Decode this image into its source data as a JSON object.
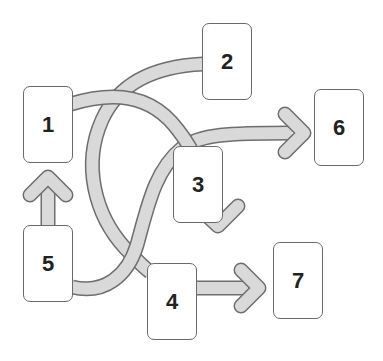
{
  "diagram": {
    "type": "flow",
    "colors": {
      "background": "#ffffff",
      "arrow_fill": "#d9d9d9",
      "arrow_stroke": "#6e6e6e",
      "box_border": "#6a6a6a",
      "label": "#222222"
    },
    "nodes": [
      {
        "id": "1",
        "label": "1",
        "x": 23,
        "y": 86,
        "w": 50,
        "h": 77
      },
      {
        "id": "2",
        "label": "2",
        "x": 202,
        "y": 23,
        "w": 50,
        "h": 77
      },
      {
        "id": "3",
        "label": "3",
        "x": 173,
        "y": 146,
        "w": 50,
        "h": 77
      },
      {
        "id": "4",
        "label": "4",
        "x": 147,
        "y": 263,
        "w": 50,
        "h": 77
      },
      {
        "id": "5",
        "label": "5",
        "x": 23,
        "y": 225,
        "w": 50,
        "h": 77
      },
      {
        "id": "6",
        "label": "6",
        "x": 314,
        "y": 89,
        "w": 50,
        "h": 77
      },
      {
        "id": "7",
        "label": "7",
        "x": 273,
        "y": 242,
        "w": 50,
        "h": 77
      }
    ],
    "edges": [
      {
        "from": "1",
        "to": "3",
        "style": "curved-arrow"
      },
      {
        "from": "2",
        "to": "4",
        "style": "curved-connector"
      },
      {
        "from": "5",
        "to": "6",
        "style": "curved-arrow"
      },
      {
        "from": "5",
        "to": "1",
        "style": "straight-arrow"
      },
      {
        "from": "4",
        "to": "7",
        "style": "straight-arrow"
      }
    ]
  }
}
